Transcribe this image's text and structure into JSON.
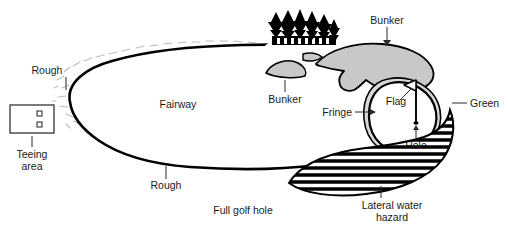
{
  "figure": {
    "caption": "Full golf hole",
    "background_color": "#ffffff",
    "line_color": "#000000",
    "sand_fill": "#c8c8c8",
    "fringe_fill": "#d9d9d9",
    "green_fill": "#ffffff",
    "hazard_fill": "#ffffff",
    "hazard_stripe_color": "#000000",
    "rough_dash_color": "#bdbdbd"
  },
  "labels": {
    "rough_upper": "Rough",
    "rough_lower": "Rough",
    "fairway": "Fairway",
    "teeing_area_line1": "Teeing",
    "teeing_area_line2": "area",
    "bunker_small": "Bunker",
    "bunker_large": "Bunker",
    "fringe": "Fringe",
    "flag": "Flag",
    "hole": "Hole",
    "green": "Green",
    "hazard_line1": "Lateral water",
    "hazard_line2": "hazard"
  },
  "features": [
    {
      "name": "teeing-area",
      "label": "Teeing area",
      "marker_count": 2
    },
    {
      "name": "fairway",
      "label": "Fairway"
    },
    {
      "name": "rough",
      "label": "Rough"
    },
    {
      "name": "bunker-small",
      "label": "Bunker"
    },
    {
      "name": "bunker-large",
      "label": "Bunker"
    },
    {
      "name": "fringe",
      "label": "Fringe"
    },
    {
      "name": "green",
      "label": "Green"
    },
    {
      "name": "flag",
      "label": "Flag"
    },
    {
      "name": "hole",
      "label": "Hole"
    },
    {
      "name": "lateral-water-hazard",
      "label": "Lateral water hazard"
    },
    {
      "name": "trees",
      "label": "Trees",
      "tree_count": 6
    }
  ]
}
